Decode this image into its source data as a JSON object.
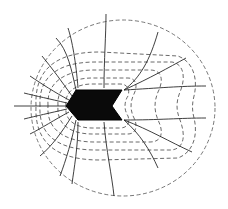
{
  "diagram": {
    "type": "field-plot",
    "colors": {
      "electrode": "#0a0a0a",
      "field_lines": "#2a2a2a",
      "equipotentials": "#444444",
      "boundary": "#555555",
      "background": "#ffffff"
    },
    "counts": {
      "field_lines": 18,
      "equipotential_contours": 5,
      "boundary_circle": 1
    }
  }
}
